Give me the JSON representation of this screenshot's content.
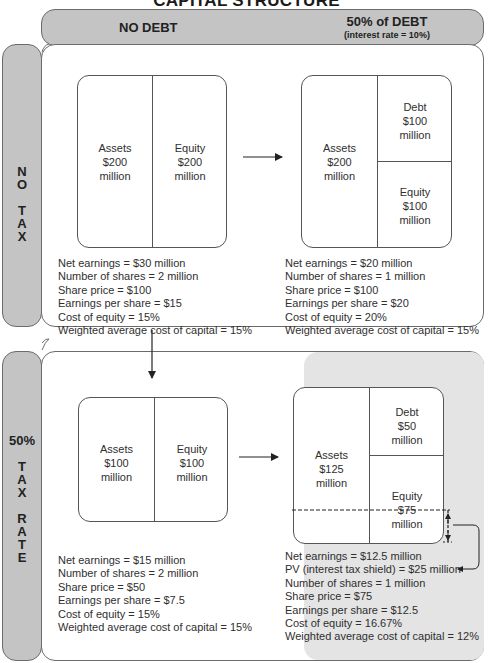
{
  "title": "CAPITAL STRUCTURE",
  "columns": {
    "no_debt": "NO DEBT",
    "debt": {
      "label": "50% of DEBT",
      "sublabel": "(interest rate = 10%)"
    }
  },
  "rows": {
    "no_tax": {
      "lines": [
        "N",
        "O",
        "",
        "T",
        "A",
        "X"
      ]
    },
    "tax": {
      "pct": "50%",
      "lines": [
        "T",
        "A",
        "X",
        "",
        "R",
        "A",
        "T",
        "E"
      ]
    }
  },
  "cells": {
    "no_tax_no_debt": {
      "assets": [
        "Assets",
        "$200",
        "million"
      ],
      "equity": [
        "Equity",
        "$200",
        "million"
      ],
      "stats": [
        "Net earnings = $30 million",
        "Number of shares = 2 million",
        "Share price = $100",
        "Earnings per share = $15",
        "Cost of equity = 15%",
        "Weighted average cost of capital = 15%"
      ]
    },
    "no_tax_debt": {
      "assets": [
        "Assets",
        "$200",
        "million"
      ],
      "debt": [
        "Debt",
        "$100",
        "million"
      ],
      "equity": [
        "Equity",
        "$100",
        "million"
      ],
      "stats": [
        "Net earnings = $20 million",
        "Number of shares = 1 million",
        "Share price = $100",
        "Earnings per share = $20",
        "Cost of equity = 20%",
        "Weighted average cost of capital = 15%"
      ]
    },
    "tax_no_debt": {
      "assets": [
        "Assets",
        "$100",
        "million"
      ],
      "equity": [
        "Equity",
        "$100",
        "million"
      ],
      "stats": [
        "Net earnings = $15 million",
        "Number of shares = 2 million",
        "Share price = $50",
        "Earnings per share = $7.5",
        "Cost of equity = 15%",
        "Weighted average cost of capital = 15%"
      ]
    },
    "tax_debt": {
      "assets": [
        "Assets",
        "$125",
        "million"
      ],
      "debt": [
        "Debt",
        "$50",
        "million"
      ],
      "equity": [
        "Equity",
        "$75",
        "million"
      ],
      "stats": [
        "Net earnings = $12.5 million",
        "PV (interest tax shield) = $25 million",
        "Number of shares = 1 million",
        "Share price = $75",
        "Earnings per share = $12.5",
        "Cost of equity = 16.67%",
        "Weighted average cost of capital = 12%"
      ]
    }
  },
  "colors": {
    "header_fill": "#c4c4c4",
    "shade_fill": "#e4e4e4",
    "border": "#6b6b6b",
    "text": "#2f2f2f"
  }
}
